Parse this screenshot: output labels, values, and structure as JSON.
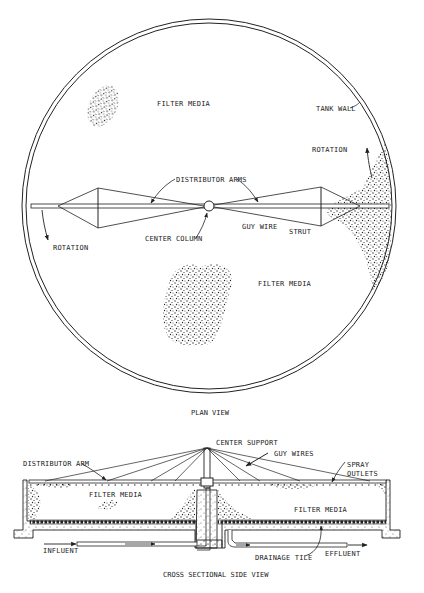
{
  "plan_view": {
    "title": "PLAN VIEW",
    "labels": {
      "filter_media_top": "FILTER MEDIA",
      "tank_wall": "TANK WALL",
      "rotation_right": "ROTATION",
      "distributor_arms": "DISTRIBUTOR ARMS",
      "rotation_left": "ROTATION",
      "center_column": "CENTER COLUMN",
      "guy_wire": "GUY WIRE",
      "strut": "STRUT",
      "filter_media_bottom": "FILTER MEDIA"
    }
  },
  "side_view": {
    "title": "CROSS SECTIONAL SIDE VIEW",
    "labels": {
      "center_support": "CENTER SUPPORT",
      "distributor_arm": "DISTRIBUTOR ARM",
      "guy_wires": "GUY WIRES",
      "spray": "SPRAY",
      "outlets": "OUTLETS",
      "filter_media_left": "FILTER MEDIA",
      "filter_media_right": "FILTER MEDIA",
      "influent": "INFLUENT",
      "drainage_tile": "DRAINAGE TILE",
      "effluent": "EFFLUENT"
    }
  },
  "colors": {
    "line": "#222222",
    "background": "#ffffff"
  }
}
